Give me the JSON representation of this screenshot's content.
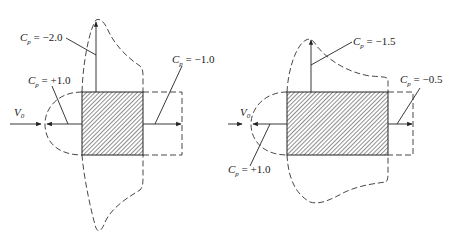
{
  "figure": {
    "left_panel": {
      "freestream_label": "V",
      "freestream_subscript": "0",
      "labels": [
        {
          "id": "top",
          "symbol": "C",
          "subscript": "p",
          "text": " =  −2.0"
        },
        {
          "id": "front",
          "symbol": "C",
          "subscript": "p",
          "text": " =  +1.0"
        },
        {
          "id": "back",
          "symbol": "C",
          "subscript": "p",
          "text": " =  −1.0"
        }
      ]
    },
    "right_panel": {
      "freestream_label": "V",
      "freestream_subscript": "0",
      "labels": [
        {
          "id": "top",
          "symbol": "C",
          "subscript": "p",
          "text": " =  −1.5"
        },
        {
          "id": "back",
          "symbol": "C",
          "subscript": "p",
          "text": " =  −0.5"
        },
        {
          "id": "front",
          "symbol": "C",
          "subscript": "p",
          "text": " =  +1.0"
        }
      ]
    },
    "colors": {
      "ink": "#222222",
      "background": "#ffffff"
    }
  }
}
